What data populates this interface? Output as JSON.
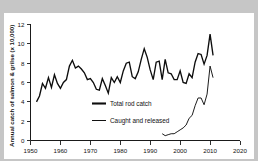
{
  "chart_data": {
    "type": "line",
    "title": "",
    "xlabel": "",
    "ylabel": "Annual catch of salmon & grilse (x 10,000)",
    "xlim": [
      1950,
      2020
    ],
    "ylim": [
      0,
      12
    ],
    "xticks": [
      1950,
      1960,
      1970,
      1980,
      1990,
      2000,
      2010,
      2020
    ],
    "yticks": [
      0,
      2,
      4,
      6,
      8,
      10,
      12
    ],
    "grid": false,
    "legend_position": "center",
    "series": [
      {
        "name": "Total rod catch",
        "color": "#0d0d0d",
        "x": [
          1952,
          1953,
          1954,
          1955,
          1956,
          1957,
          1958,
          1959,
          1960,
          1961,
          1962,
          1963,
          1964,
          1965,
          1966,
          1967,
          1968,
          1969,
          1970,
          1971,
          1972,
          1973,
          1974,
          1975,
          1976,
          1977,
          1978,
          1979,
          1980,
          1981,
          1982,
          1983,
          1984,
          1985,
          1986,
          1987,
          1988,
          1989,
          1990,
          1991,
          1992,
          1993,
          1994,
          1995,
          1996,
          1997,
          1998,
          1999,
          2000,
          2001,
          2002,
          2003,
          2004,
          2005,
          2006,
          2007,
          2008,
          2009,
          2010,
          2011
        ],
        "values": [
          4.0,
          4.6,
          5.9,
          5.4,
          6.5,
          5.5,
          6.8,
          5.9,
          5.4,
          6.0,
          6.3,
          7.7,
          8.3,
          7.5,
          7.7,
          7.4,
          7.0,
          6.3,
          6.4,
          6.0,
          5.3,
          5.2,
          6.4,
          5.7,
          4.9,
          6.5,
          6.0,
          6.6,
          6.0,
          7.2,
          8.0,
          8.1,
          6.6,
          6.4,
          7.1,
          8.4,
          9.5,
          8.6,
          7.3,
          6.3,
          8.1,
          8.2,
          6.3,
          8.4,
          7.0,
          6.9,
          6.3,
          6.3,
          7.2,
          6.0,
          5.9,
          6.9,
          6.5,
          8.1,
          9.0,
          8.9,
          7.9,
          8.8,
          11.0,
          8.8
        ]
      },
      {
        "name": "Caught and released",
        "color": "#111111",
        "x": [
          1994,
          1995,
          1996,
          1997,
          1998,
          1999,
          2000,
          2001,
          2002,
          2003,
          2004,
          2005,
          2006,
          2007,
          2008,
          2009,
          2010,
          2011
        ],
        "values": [
          0.7,
          0.5,
          0.6,
          0.7,
          0.7,
          0.9,
          1.1,
          1.3,
          1.6,
          2.3,
          2.6,
          3.6,
          4.4,
          4.4,
          3.7,
          4.8,
          7.7,
          6.5
        ]
      }
    ]
  },
  "axis": {
    "y_title": "Annual catch of salmon & grilse (x 10,000)",
    "x_tick_labels": [
      "1950",
      "1960",
      "1970",
      "1980",
      "1990",
      "2000",
      "2010",
      "2020"
    ],
    "y_tick_labels": [
      "0",
      "2",
      "4",
      "6",
      "8",
      "10",
      "12"
    ]
  },
  "legend": {
    "entries": [
      {
        "label": "Total rod catch"
      },
      {
        "label": "Caught and released"
      }
    ]
  }
}
